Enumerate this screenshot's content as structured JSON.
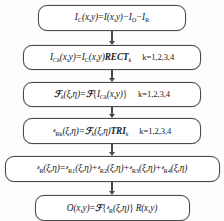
{
  "diagram": {
    "type": "vertical-flowchart",
    "background_color": "#fdfdfc",
    "stroke_color": "#4a4a48",
    "text_color": "#1b1b1b",
    "arrow_count": 5,
    "nodes": [
      {
        "id": "step-1",
        "name": "contrast-image-equation",
        "equation_text": "I_C(x,y)=I(x,y)-I_O-I_R",
        "lhs": "I_C(x,y)",
        "rhs": "I(x,y) - I_O - I_R",
        "condition": "",
        "parts": {
          "lhs_symbol": "I",
          "lhs_sub": "C",
          "lhs_args": "(x,y)",
          "equals": "=",
          "t1_symbol": "I",
          "t1_args": "(x,y)",
          "minus1": "−",
          "t2_symbol": "I",
          "t2_sub": "O",
          "minus2": "−",
          "t3_symbol": "I",
          "t3_sub": "R"
        }
      },
      {
        "id": "step-2",
        "name": "rect-window-equation",
        "equation_text": "I_Ck(x,y)=I_C(x,y)RECT_k",
        "condition": "k=1,2,3,4",
        "parts": {
          "lhs_symbol": "I",
          "lhs_sub": "Ck",
          "lhs_args": "(x,y)",
          "equals": "=",
          "r1_symbol": "I",
          "r1_sub": "C",
          "r1_args": "(x,y)",
          "window": "RECT",
          "window_sub": "k"
        }
      },
      {
        "id": "step-3",
        "name": "fourier-transform-equation",
        "equation_text": "F_k(ξ,η)=F{I_Ck(x,y)}",
        "condition": "k=1,2,3,4",
        "parts": {
          "lhs_symbol": "ℱ",
          "lhs_sub": "k",
          "lhs_args": "(ξ,η)",
          "equals": "=",
          "operator": "ℱ",
          "brace_open": "{",
          "inner_symbol": "I",
          "inner_sub": "Ck",
          "inner_args": "(x,y)",
          "brace_close": "}"
        }
      },
      {
        "id": "step-4",
        "name": "tri-filter-equation",
        "equation_text": "G_Rk(ξ,η)=F_k(ξ,η)TRI_k",
        "condition": "k=1,2,3,4",
        "parts": {
          "lhs_symbol": "ᵊ",
          "lhs_sub": "Rk",
          "lhs_args": "(ξ,η)",
          "equals": "=",
          "r1_symbol": "ℱ",
          "r1_sub": "k",
          "r1_args": "(ξ,η)",
          "window": "TRI",
          "window_sub": "k"
        }
      },
      {
        "id": "step-5",
        "name": "summation-equation",
        "equation_text": "G_R(ξ,η)=G_R1(ξ,η)+G_R2(ξ,η)+G_R3(ξ,η)+G_R4(ξ,η)",
        "condition": "",
        "parts": {
          "lhs_symbol": "ᵊ",
          "lhs_sub": "R",
          "lhs_args": "(ξ,η)",
          "equals": "=",
          "t1_sub": "R1",
          "plus1": "+",
          "t2_sub": "R2",
          "plus2": "+",
          "t3_sub": "R3",
          "plus3": "+",
          "t4_sub": "R4",
          "args": "(ξ,η)",
          "symbol": "ᵊ"
        }
      },
      {
        "id": "step-6",
        "name": "output-image-equation",
        "equation_text": "O(x,y)=F{G_R(ξ,η)}R(x,y)",
        "condition": "",
        "parts": {
          "lhs_symbol": "O",
          "lhs_args": "(x,y)",
          "equals": "=",
          "operator": "ℱ",
          "brace_open": "{",
          "inner_symbol": "ᵊ",
          "inner_sub": "R",
          "inner_args": "(ξ,η)",
          "brace_close": "}",
          "tail_symbol": "R",
          "tail_args": "(x,y)"
        }
      }
    ]
  }
}
